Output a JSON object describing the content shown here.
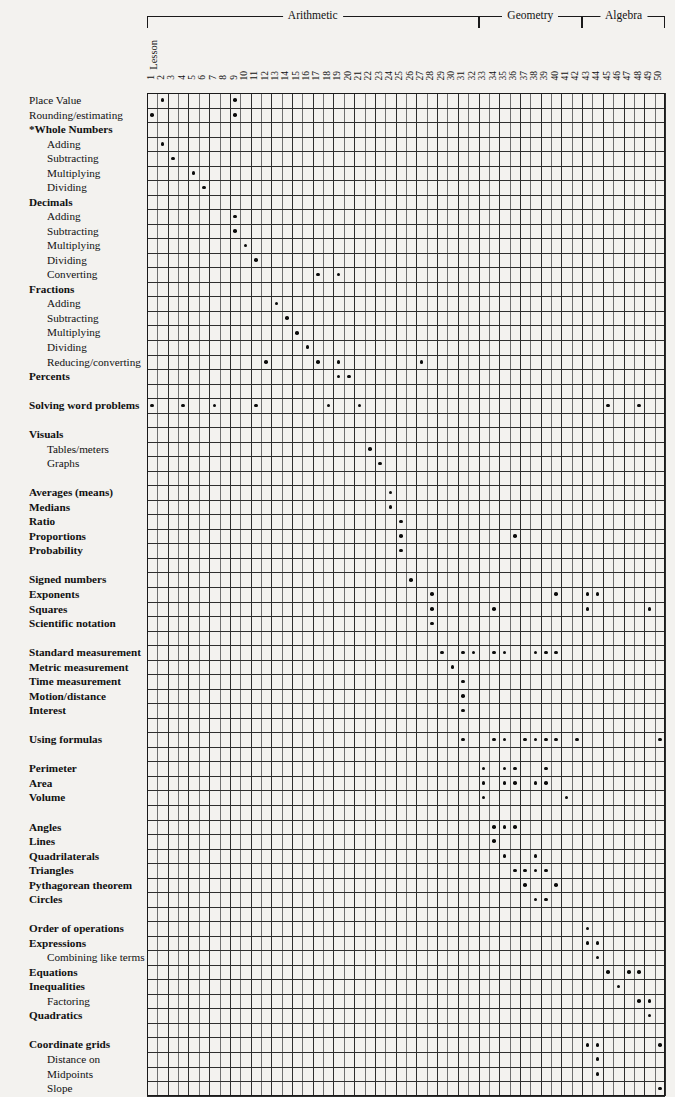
{
  "axis": {
    "lesson_label": "Lesson",
    "columns": [
      1,
      2,
      3,
      4,
      5,
      6,
      7,
      8,
      9,
      10,
      11,
      12,
      13,
      14,
      15,
      16,
      17,
      18,
      19,
      20,
      21,
      22,
      23,
      24,
      25,
      26,
      27,
      28,
      29,
      30,
      31,
      32,
      33,
      34,
      35,
      36,
      37,
      38,
      39,
      40,
      41,
      42,
      43,
      44,
      45,
      46,
      47,
      48,
      49,
      50
    ],
    "column_count": 50
  },
  "groups": [
    {
      "label": "Arithmetic",
      "start": 1,
      "end": 32
    },
    {
      "label": "Geometry",
      "start": 33,
      "end": 42
    },
    {
      "label": "Algebra",
      "start": 43,
      "end": 50
    }
  ],
  "chart_data": {
    "type": "heatmap",
    "xlabel": "Lesson",
    "ylabel": "",
    "x": [
      1,
      2,
      3,
      4,
      5,
      6,
      7,
      8,
      9,
      10,
      11,
      12,
      13,
      14,
      15,
      16,
      17,
      18,
      19,
      20,
      21,
      22,
      23,
      24,
      25,
      26,
      27,
      28,
      29,
      30,
      31,
      32,
      33,
      34,
      35,
      36,
      37,
      38,
      39,
      40,
      41,
      42,
      43,
      44,
      45,
      46,
      47,
      48,
      49,
      50
    ],
    "legend_position": "none",
    "grid": true,
    "note": "A dot marks the lesson(s) in which each skill is taught.",
    "rows": [
      {
        "label": "Place Value",
        "style": "plain",
        "indent": 0,
        "spacer_before": 0,
        "lessons": [
          2,
          9
        ]
      },
      {
        "label": "Rounding/estimating",
        "style": "plain",
        "indent": 0,
        "spacer_before": 0,
        "lessons": [
          1,
          9
        ]
      },
      {
        "label": "*Whole Numbers",
        "style": "bold",
        "indent": 0,
        "spacer_before": 0,
        "lessons": []
      },
      {
        "label": "Adding",
        "style": "plain",
        "indent": 1,
        "spacer_before": 0,
        "lessons": [
          2
        ]
      },
      {
        "label": "Subtracting",
        "style": "plain",
        "indent": 1,
        "spacer_before": 0,
        "lessons": [
          3
        ]
      },
      {
        "label": "Multiplying",
        "style": "plain",
        "indent": 1,
        "spacer_before": 0,
        "lessons": [
          5
        ]
      },
      {
        "label": "Dividing",
        "style": "plain",
        "indent": 1,
        "spacer_before": 0,
        "lessons": [
          6
        ]
      },
      {
        "label": "Decimals",
        "style": "bold",
        "indent": 0,
        "spacer_before": 0,
        "lessons": []
      },
      {
        "label": "Adding",
        "style": "plain",
        "indent": 1,
        "spacer_before": 0,
        "lessons": [
          9
        ]
      },
      {
        "label": "Subtracting",
        "style": "plain",
        "indent": 1,
        "spacer_before": 0,
        "lessons": [
          9
        ]
      },
      {
        "label": "Multiplying",
        "style": "plain",
        "indent": 1,
        "spacer_before": 0,
        "lessons": [
          10
        ]
      },
      {
        "label": "Dividing",
        "style": "plain",
        "indent": 1,
        "spacer_before": 0,
        "lessons": [
          11
        ]
      },
      {
        "label": "Converting",
        "style": "plain",
        "indent": 1,
        "spacer_before": 0,
        "lessons": [
          17,
          19
        ]
      },
      {
        "label": "Fractions",
        "style": "bold",
        "indent": 0,
        "spacer_before": 0,
        "lessons": []
      },
      {
        "label": "Adding",
        "style": "plain",
        "indent": 1,
        "spacer_before": 0,
        "lessons": [
          13
        ]
      },
      {
        "label": "Subtracting",
        "style": "plain",
        "indent": 1,
        "spacer_before": 0,
        "lessons": [
          14
        ]
      },
      {
        "label": "Multiplying",
        "style": "plain",
        "indent": 1,
        "spacer_before": 0,
        "lessons": [
          15
        ]
      },
      {
        "label": "Dividing",
        "style": "plain",
        "indent": 1,
        "spacer_before": 0,
        "lessons": [
          16
        ]
      },
      {
        "label": "Reducing/converting",
        "style": "plain",
        "indent": 1,
        "spacer_before": 0,
        "lessons": [
          12,
          17,
          19,
          27
        ]
      },
      {
        "label": "Percents",
        "style": "bold",
        "indent": 0,
        "spacer_before": 0,
        "lessons": [
          19,
          20
        ]
      },
      {
        "label": "Solving word problems",
        "style": "bold",
        "indent": 0,
        "spacer_before": 1,
        "lessons": [
          1,
          4,
          7,
          11,
          18,
          21,
          45,
          48
        ]
      },
      {
        "label": "Visuals",
        "style": "bold",
        "indent": 0,
        "spacer_before": 1,
        "lessons": []
      },
      {
        "label": "Tables/meters",
        "style": "plain",
        "indent": 1,
        "spacer_before": 0,
        "lessons": [
          22
        ]
      },
      {
        "label": "Graphs",
        "style": "plain",
        "indent": 1,
        "spacer_before": 0,
        "lessons": [
          23
        ]
      },
      {
        "label": "Averages (means)",
        "style": "bold",
        "indent": 0,
        "spacer_before": 1,
        "lessons": [
          24
        ]
      },
      {
        "label": "Medians",
        "style": "bold",
        "indent": 0,
        "spacer_before": 0,
        "lessons": [
          24
        ]
      },
      {
        "label": "Ratio",
        "style": "bold",
        "indent": 0,
        "spacer_before": 0,
        "lessons": [
          25
        ]
      },
      {
        "label": "Proportions",
        "style": "bold",
        "indent": 0,
        "spacer_before": 0,
        "lessons": [
          25,
          36
        ]
      },
      {
        "label": "Probability",
        "style": "bold",
        "indent": 0,
        "spacer_before": 0,
        "lessons": [
          25
        ]
      },
      {
        "label": "Signed numbers",
        "style": "bold",
        "indent": 0,
        "spacer_before": 1,
        "lessons": [
          26
        ]
      },
      {
        "label": "Exponents",
        "style": "bold",
        "indent": 0,
        "spacer_before": 0,
        "lessons": [
          28,
          40,
          43,
          44
        ]
      },
      {
        "label": "Squares",
        "style": "bold",
        "indent": 0,
        "spacer_before": 0,
        "lessons": [
          28,
          34,
          43,
          49
        ]
      },
      {
        "label": "Scientific notation",
        "style": "bold",
        "indent": 0,
        "spacer_before": 0,
        "lessons": [
          28
        ]
      },
      {
        "label": "Standard measurement",
        "style": "bold",
        "indent": 0,
        "spacer_before": 1,
        "lessons": [
          29,
          31,
          32,
          34,
          35,
          38,
          39,
          40
        ]
      },
      {
        "label": "Metric measurement",
        "style": "bold",
        "indent": 0,
        "spacer_before": 0,
        "lessons": [
          30
        ]
      },
      {
        "label": "Time measurement",
        "style": "bold",
        "indent": 0,
        "spacer_before": 0,
        "lessons": [
          31
        ]
      },
      {
        "label": "Motion/distance",
        "style": "bold",
        "indent": 0,
        "spacer_before": 0,
        "lessons": [
          31
        ]
      },
      {
        "label": "Interest",
        "style": "bold",
        "indent": 0,
        "spacer_before": 0,
        "lessons": [
          31
        ]
      },
      {
        "label": "Using formulas",
        "style": "bold",
        "indent": 0,
        "spacer_before": 1,
        "lessons": [
          31,
          34,
          35,
          37,
          38,
          39,
          40,
          42,
          50
        ]
      },
      {
        "label": "Perimeter",
        "style": "bold",
        "indent": 0,
        "spacer_before": 1,
        "lessons": [
          33,
          35,
          36,
          39
        ]
      },
      {
        "label": "Area",
        "style": "bold",
        "indent": 0,
        "spacer_before": 0,
        "lessons": [
          33,
          35,
          36,
          38,
          39
        ]
      },
      {
        "label": "Volume",
        "style": "bold",
        "indent": 0,
        "spacer_before": 0,
        "lessons": [
          33,
          41
        ]
      },
      {
        "label": "Angles",
        "style": "bold",
        "indent": 0,
        "spacer_before": 1,
        "lessons": [
          34,
          35,
          36
        ]
      },
      {
        "label": "Lines",
        "style": "bold",
        "indent": 0,
        "spacer_before": 0,
        "lessons": [
          34
        ]
      },
      {
        "label": "Quadrilaterals",
        "style": "bold",
        "indent": 0,
        "spacer_before": 0,
        "lessons": [
          35,
          38
        ]
      },
      {
        "label": "Triangles",
        "style": "bold",
        "indent": 0,
        "spacer_before": 0,
        "lessons": [
          36,
          37,
          38,
          39
        ]
      },
      {
        "label": "Pythagorean theorem",
        "style": "bold",
        "indent": 0,
        "spacer_before": 0,
        "lessons": [
          37,
          40
        ]
      },
      {
        "label": "Circles",
        "style": "bold",
        "indent": 0,
        "spacer_before": 0,
        "lessons": [
          38,
          39
        ]
      },
      {
        "label": "Order of operations",
        "style": "bold",
        "indent": 0,
        "spacer_before": 1,
        "lessons": [
          43
        ]
      },
      {
        "label": "Expressions",
        "style": "bold",
        "indent": 0,
        "spacer_before": 0,
        "lessons": [
          43,
          44
        ]
      },
      {
        "label": "Combining like terms",
        "style": "plain",
        "indent": 1,
        "spacer_before": 0,
        "lessons": [
          44
        ]
      },
      {
        "label": "Equations",
        "style": "bold",
        "indent": 0,
        "spacer_before": 0,
        "lessons": [
          45,
          47,
          48
        ]
      },
      {
        "label": "Inequalities",
        "style": "bold",
        "indent": 0,
        "spacer_before": 0,
        "lessons": [
          46
        ]
      },
      {
        "label": "Factoring",
        "style": "plain",
        "indent": 1,
        "spacer_before": 0,
        "lessons": [
          48,
          49
        ]
      },
      {
        "label": "Quadratics",
        "style": "bold",
        "indent": 0,
        "spacer_before": 0,
        "lessons": [
          49
        ]
      },
      {
        "label": "Coordinate grids",
        "style": "bold",
        "indent": 0,
        "spacer_before": 1,
        "lessons": [
          43,
          44,
          50
        ]
      },
      {
        "label": "Distance on",
        "style": "plain",
        "indent": 1,
        "spacer_before": 0,
        "lessons": [
          44
        ]
      },
      {
        "label": "Midpoints",
        "style": "plain",
        "indent": 1,
        "spacer_before": 0,
        "lessons": [
          44
        ]
      },
      {
        "label": "Slope",
        "style": "plain",
        "indent": 1,
        "spacer_before": 0,
        "lessons": [
          50
        ]
      }
    ]
  }
}
